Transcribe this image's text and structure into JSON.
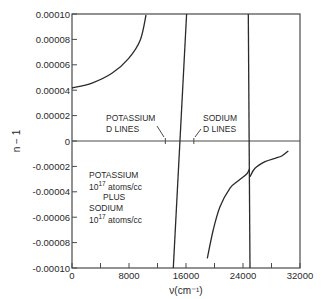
{
  "chart_data": {
    "type": "line",
    "title": "",
    "xlabel": "ν(cm⁻¹)",
    "ylabel": "n − 1",
    "xlim": [
      0,
      32000
    ],
    "ylim": [
      -0.0001,
      0.0001
    ],
    "grid": false,
    "x_ticks": [
      0,
      4000,
      8000,
      12000,
      16000,
      20000,
      24000,
      28000,
      32000
    ],
    "x_tick_labels": [
      "0",
      "",
      "8000",
      "",
      "16000",
      "",
      "24000",
      "",
      "32000"
    ],
    "y_ticks": [
      0.0001,
      8e-05,
      6e-05,
      4e-05,
      2e-05,
      0,
      -2e-05,
      -4e-05,
      -6e-05,
      -8e-05,
      -0.0001
    ],
    "y_tick_labels": [
      "0.00010",
      "0.00008",
      "0.00006",
      "0.00004",
      "0.00002",
      "0",
      "-0.00002",
      "-0.00004",
      "-0.00006",
      "-0.00008",
      "-0.00010"
    ],
    "zero_line": true,
    "series": [
      {
        "name": "low-frequency branch",
        "x": [
          0,
          2800,
          5600,
          7960,
          9580,
          10390
        ],
        "y": [
          4.17e-05,
          4.56e-05,
          5.33e-05,
          6.51e-05,
          7.95e-05,
          9.92e-05
        ]
      },
      {
        "name": "potassium resonance branch",
        "x": [
          14220,
          16090
        ],
        "y": [
          -0.0001,
          0.0001
        ]
      },
      {
        "name": "branch below sodium resonance",
        "x": [
          18990,
          19820,
          20770,
          22180,
          23340,
          24520,
          24890
        ],
        "y": [
          -9.24e-05,
          -7.01e-05,
          -5.17e-05,
          -3.72e-05,
          -3.13e-05,
          -2.6e-05,
          -2.23e-05
        ]
      },
      {
        "name": "sodium resonance branch",
        "x": [
          24980,
          24750
        ],
        "y": [
          -0.0001,
          0.0001
        ]
      },
      {
        "name": "high-frequency branch",
        "x": [
          24980,
          25680,
          27090,
          28490,
          29430,
          30360
        ],
        "y": [
          -2.81e-05,
          -2.15e-05,
          -1.63e-05,
          -1.36e-05,
          -1.18e-05,
          -7.9e-06
        ]
      }
    ],
    "annotations": [
      {
        "id": "potassium",
        "lines": [
          "POTASSIUM",
          "D LINES"
        ],
        "marker_x": 13100
      },
      {
        "id": "sodium",
        "lines": [
          "SODIUM",
          "D LINES"
        ],
        "marker_x": 17100
      }
    ],
    "legend_note": {
      "line1": "POTASSIUM",
      "line2_base": "10",
      "line2_sup": "17",
      "line2_rest": " atoms/cc",
      "line3": "PLUS",
      "line4": "SODIUM",
      "line5_base": "10",
      "line5_sup": "17",
      "line5_rest": " atoms/cc"
    }
  }
}
